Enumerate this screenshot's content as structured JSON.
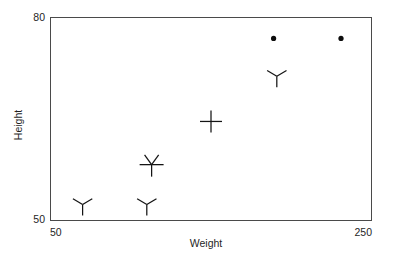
{
  "chart_data": {
    "type": "scatter",
    "title": "",
    "xlabel": "Weight",
    "ylabel": "Height",
    "xlim": [
      50,
      250
    ],
    "ylim": [
      50,
      80
    ],
    "xticks": [
      "50",
      "250"
    ],
    "yticks": [
      "50",
      "80"
    ],
    "grid": false,
    "legend": "none",
    "points": [
      {
        "label": "point-1",
        "x": 70,
        "y": 52.3,
        "marker": "y-glyph"
      },
      {
        "label": "point-2",
        "x": 110,
        "y": 52.3,
        "marker": "y-glyph"
      },
      {
        "label": "point-3",
        "x": 113,
        "y": 58.2,
        "marker": "star-glyph"
      },
      {
        "label": "point-4",
        "x": 150,
        "y": 64.6,
        "marker": "plus-glyph"
      },
      {
        "label": "point-5",
        "x": 191,
        "y": 71.3,
        "marker": "y-glyph"
      },
      {
        "label": "point-6",
        "x": 189,
        "y": 76.9,
        "marker": "dot-glyph"
      },
      {
        "label": "point-7",
        "x": 231,
        "y": 76.9,
        "marker": "dot-glyph"
      }
    ]
  },
  "axes": {
    "y_top_label": "80",
    "y_bottom_label": "50",
    "x_left_label": "50",
    "x_right_label": "250",
    "y_axis_title": "Height",
    "x_axis_title": "Weight"
  },
  "colors": {
    "frame": "#4a4a4a",
    "marker": "#141414",
    "text": "#1f1f1f",
    "background": "#ffffff"
  }
}
